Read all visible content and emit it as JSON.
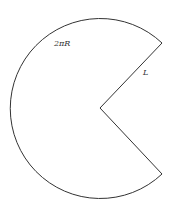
{
  "diagram": {
    "title": "",
    "shape": "circular sector (unrolled cone net)",
    "labels": {
      "arc": "2πR",
      "radius": "L"
    },
    "colors": {
      "stroke": "#333333",
      "fill": "#ffffff"
    }
  }
}
